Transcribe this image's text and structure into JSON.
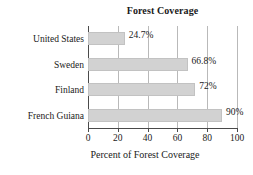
{
  "chart_data": {
    "type": "bar",
    "orientation": "horizontal",
    "title": "Forest Coverage",
    "xlabel": "Percent of Forest Coverage",
    "ylabel": "",
    "categories": [
      "United States",
      "Sweden",
      "Finland",
      "French Guiana"
    ],
    "values": [
      24.7,
      66.8,
      72,
      90
    ],
    "data_labels": [
      "24.7%",
      "66.8%",
      "72%",
      "90%"
    ],
    "xlim": [
      0,
      100
    ],
    "xticks": [
      0,
      20,
      40,
      60,
      80,
      100
    ],
    "xtick_labels": [
      "0",
      "20",
      "40",
      "60",
      "80",
      "100"
    ],
    "grid": "vertical",
    "legend": "none",
    "colors": {
      "bar_fill": "#d2d2d2",
      "bar_border": "#c2c2c2",
      "gridline": "#b9b9b9",
      "axis": "#4a4a4a",
      "text": "#1a1a1a",
      "background": "#ffffff"
    }
  }
}
